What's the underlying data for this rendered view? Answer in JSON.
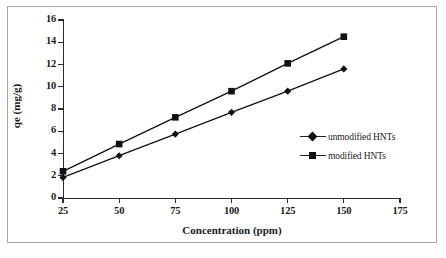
{
  "figure": {
    "background_color": "#ffffff",
    "border_color": "#a8a8a8",
    "series_color": "#111111",
    "axis_color": "#2b2b2b"
  },
  "chart_data": {
    "type": "line",
    "title": "",
    "subtitle": "",
    "xlabel": "Concentration (ppm)",
    "ylabel": "qe (mg/g)",
    "x": [
      25,
      50,
      75,
      100,
      125,
      150
    ],
    "xlim": [
      25,
      175
    ],
    "ylim": [
      0,
      16
    ],
    "xticks": [
      25,
      50,
      75,
      100,
      125,
      150,
      175
    ],
    "xtick_labels": [
      "25",
      "50",
      "75",
      "100",
      "125",
      "150",
      "175"
    ],
    "yticks": [
      0,
      2,
      4,
      6,
      8,
      10,
      12,
      14,
      16
    ],
    "ytick_labels": [
      "0",
      "2",
      "4",
      "6",
      "8",
      "10",
      "12",
      "14",
      "16"
    ],
    "grid": false,
    "legend_position": "center-right",
    "series": [
      {
        "name": "unmodified HNTs",
        "marker": "diamond",
        "values": [
          1.85,
          3.8,
          5.75,
          7.7,
          9.6,
          11.6
        ]
      },
      {
        "name": "modified HNTs",
        "marker": "square",
        "values": [
          2.4,
          4.85,
          7.25,
          9.6,
          12.1,
          14.5
        ]
      }
    ]
  },
  "legend": {
    "items": [
      {
        "label": "unmodified HNTs",
        "marker": "diamond"
      },
      {
        "label": "modified HNTs",
        "marker": "square"
      }
    ]
  }
}
